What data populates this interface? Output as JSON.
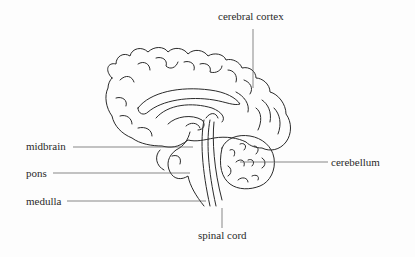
{
  "diagram": {
    "labels": [
      {
        "id": "cerebral-cortex",
        "text": "cerebral cortex",
        "x": 218,
        "y": 11
      },
      {
        "id": "midbrain",
        "text": "midbrain",
        "x": 26,
        "y": 141
      },
      {
        "id": "pons",
        "text": "pons",
        "x": 26,
        "y": 168
      },
      {
        "id": "medulla",
        "text": "medulla",
        "x": 26,
        "y": 196
      },
      {
        "id": "cerebellum",
        "text": "cerebellum",
        "x": 331,
        "y": 157
      },
      {
        "id": "spinal-cord",
        "text": "spinal cord",
        "x": 198,
        "y": 230
      }
    ],
    "colors": {
      "background": "#fdfdfd",
      "ink": "#2a2a2a",
      "leader": "#555555"
    }
  }
}
